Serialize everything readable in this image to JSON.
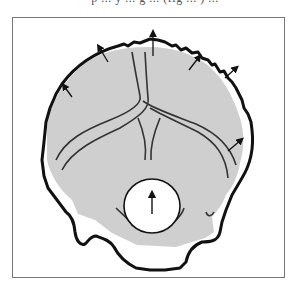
{
  "caption": {
    "text": "p ... y ... g ... (fig ... ) ...",
    "clipped": true
  },
  "figure": {
    "type": "anatomical-diagram",
    "colors": {
      "fill": "#cfcfcf",
      "outer_outline": "#111111",
      "inner_lines": "#333333",
      "frame": "#777777",
      "foramen": "#ffffff"
    },
    "elements": {
      "outer_outline": "thick jagged outer contour",
      "inner_shape": "gray shaded bone region",
      "sutures": "curved internal lines meeting at center",
      "foramen": "white circular opening near bottom",
      "growth_arrows": 7
    }
  }
}
